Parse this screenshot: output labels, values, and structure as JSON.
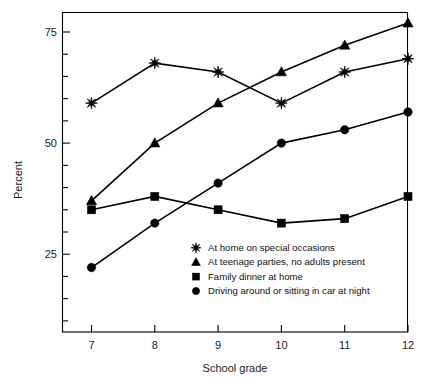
{
  "chart_data": {
    "type": "line",
    "title": "",
    "xlabel": "School grade",
    "ylabel": "Percent",
    "x": [
      7,
      8,
      9,
      10,
      11,
      12
    ],
    "categories": [
      "7",
      "8",
      "9",
      "10",
      "11",
      "12"
    ],
    "xlim": [
      6.55,
      12.0
    ],
    "ylim": [
      7.5,
      79.5
    ],
    "y_major_ticks": [
      25,
      50,
      75
    ],
    "y_major_tick_labels": [
      "25",
      "50",
      "75"
    ],
    "y_minor_tick_step": 5,
    "grid": false,
    "legend_position": "center-bottom-inside",
    "series": [
      {
        "name": "At home on special occasions",
        "marker": "star",
        "values": [
          59,
          68,
          66,
          59,
          66,
          69
        ]
      },
      {
        "name": "At teenage parties, no adults present",
        "marker": "triangle",
        "values": [
          37,
          50,
          59,
          66,
          72,
          77
        ]
      },
      {
        "name": "Family dinner at home",
        "marker": "square",
        "values": [
          35,
          38,
          35,
          32,
          33,
          38
        ]
      },
      {
        "name": "Driving around or sitting in car at night",
        "marker": "circle",
        "values": [
          22,
          32,
          41,
          50,
          53,
          57
        ]
      }
    ]
  },
  "axes": {
    "y_label": "Percent",
    "x_label": "School grade",
    "y_ticks": [
      "75",
      "50",
      "25"
    ],
    "x_ticks": [
      "7",
      "8",
      "9",
      "10",
      "11",
      "12"
    ]
  },
  "legend": {
    "entries": [
      {
        "marker": "star-marker",
        "label": "At home on special occasions"
      },
      {
        "marker": "triangle-marker",
        "label": "At teenage parties, no adults present"
      },
      {
        "marker": "square-marker",
        "label": "Family dinner at home"
      },
      {
        "marker": "circle-marker",
        "label": "Driving around or sitting in car at night"
      }
    ]
  },
  "colors": {
    "ink": "#000000",
    "background": "#ffffff"
  }
}
